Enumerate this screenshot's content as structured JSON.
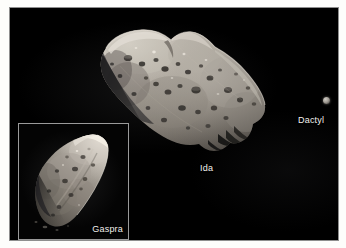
{
  "figure": {
    "caption_absent": true,
    "background_color": "#fdfdfb",
    "sky_color": "#000000",
    "border_color": "#8e8e8e"
  },
  "objects": [
    {
      "id": "ida",
      "label": "Ida",
      "kind": "asteroid",
      "description": "large elongated heavily cratered asteroid, illuminated from upper left"
    },
    {
      "id": "dactyl",
      "label": "Dactyl",
      "kind": "moon",
      "description": "tiny moon of Ida, small bright dot at right of frame"
    },
    {
      "id": "gaspra",
      "label": "Gaspra",
      "kind": "asteroid",
      "description": "wedge shaped asteroid shown in bordered inset at lower left"
    }
  ],
  "labels": {
    "ida": "Ida",
    "dactyl": "Dactyl",
    "gaspra": "Gaspra"
  },
  "inset": {
    "border_color": "#9a9a9a",
    "background_color": "#040404"
  },
  "colors": {
    "label_text": "#f2f0ec",
    "asteroid_light": "#cfcac1",
    "asteroid_mid": "#8e8a82",
    "asteroid_dark": "#3a3834",
    "asteroid_shadow": "#111110"
  }
}
